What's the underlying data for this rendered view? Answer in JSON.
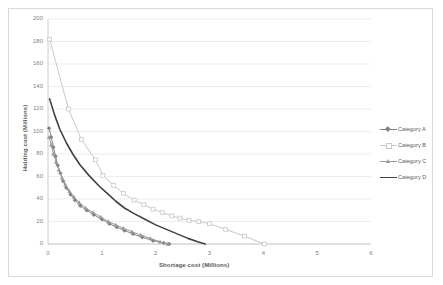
{
  "chart_data": {
    "type": "line",
    "title": "",
    "xlabel": "Shortage cost (Millions)",
    "ylabel": "Holding cost (Millions)",
    "xlim": [
      0,
      6
    ],
    "ylim": [
      0,
      200
    ],
    "xticks": [
      "0",
      "1",
      "2",
      "3",
      "4",
      "5",
      "6"
    ],
    "yticks": [
      "0",
      "20",
      "40",
      "60",
      "80",
      "100",
      "120",
      "140",
      "160",
      "180",
      "200"
    ],
    "grid": "horizontal",
    "legend_position": "right",
    "series": [
      {
        "name": "Category A",
        "color": "#808080",
        "marker": "diamond",
        "points": [
          [
            0.02,
            103
          ],
          [
            0.06,
            95
          ],
          [
            0.1,
            86
          ],
          [
            0.14,
            78
          ],
          [
            0.18,
            70
          ],
          [
            0.23,
            63
          ],
          [
            0.28,
            56
          ],
          [
            0.34,
            50
          ],
          [
            0.42,
            44
          ],
          [
            0.5,
            39
          ],
          [
            0.6,
            34
          ],
          [
            0.72,
            30
          ],
          [
            0.85,
            26
          ],
          [
            1.0,
            22
          ],
          [
            1.14,
            18
          ],
          [
            1.28,
            15
          ],
          [
            1.42,
            12
          ],
          [
            1.58,
            9
          ],
          [
            1.75,
            6
          ],
          [
            1.95,
            3
          ],
          [
            2.15,
            1
          ],
          [
            2.25,
            0
          ]
        ]
      },
      {
        "name": "Category B",
        "color": "#c8c8c8",
        "marker": "square",
        "points": [
          [
            0.03,
            182
          ],
          [
            0.38,
            120
          ],
          [
            0.62,
            93
          ],
          [
            0.88,
            75
          ],
          [
            1.02,
            61
          ],
          [
            1.22,
            52
          ],
          [
            1.4,
            45
          ],
          [
            1.6,
            39
          ],
          [
            1.78,
            35
          ],
          [
            1.95,
            31
          ],
          [
            2.12,
            28
          ],
          [
            2.3,
            25
          ],
          [
            2.45,
            23
          ],
          [
            2.62,
            21
          ],
          [
            2.8,
            20
          ],
          [
            3.0,
            18
          ],
          [
            3.3,
            13
          ],
          [
            3.65,
            7
          ],
          [
            4.02,
            0
          ]
        ]
      },
      {
        "name": "Category C",
        "color": "#9a9a9a",
        "marker": "triangle",
        "points": [
          [
            0.02,
            95
          ],
          [
            0.06,
            88
          ],
          [
            0.1,
            80
          ],
          [
            0.15,
            73
          ],
          [
            0.2,
            66
          ],
          [
            0.26,
            59
          ],
          [
            0.32,
            53
          ],
          [
            0.4,
            47
          ],
          [
            0.48,
            42
          ],
          [
            0.58,
            37
          ],
          [
            0.7,
            32
          ],
          [
            0.84,
            28
          ],
          [
            0.98,
            24
          ],
          [
            1.12,
            20
          ],
          [
            1.26,
            17
          ],
          [
            1.4,
            14
          ],
          [
            1.56,
            11
          ],
          [
            1.72,
            8
          ],
          [
            1.9,
            5
          ],
          [
            2.08,
            2
          ],
          [
            2.22,
            0
          ]
        ]
      },
      {
        "name": "Category D",
        "color": "#404040",
        "marker": "none",
        "points": [
          [
            0.03,
            129
          ],
          [
            0.12,
            115
          ],
          [
            0.22,
            102
          ],
          [
            0.34,
            90
          ],
          [
            0.46,
            80
          ],
          [
            0.6,
            70
          ],
          [
            0.76,
            61
          ],
          [
            0.94,
            52
          ],
          [
            1.1,
            45
          ],
          [
            1.26,
            38
          ],
          [
            1.42,
            32
          ],
          [
            1.6,
            27
          ],
          [
            1.8,
            22
          ],
          [
            2.0,
            17
          ],
          [
            2.2,
            13
          ],
          [
            2.4,
            9
          ],
          [
            2.6,
            5
          ],
          [
            2.78,
            2
          ],
          [
            2.92,
            0
          ]
        ]
      }
    ]
  },
  "legend": {
    "items": [
      {
        "label": "Category A"
      },
      {
        "label": "Category B"
      },
      {
        "label": "Category C"
      },
      {
        "label": "Category D"
      }
    ]
  }
}
